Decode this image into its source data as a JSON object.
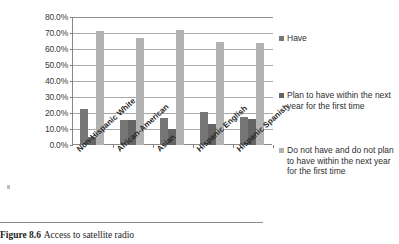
{
  "chart_data": {
    "type": "bar",
    "title": "",
    "xlabel": "",
    "ylabel": "",
    "ylim": [
      0,
      80
    ],
    "ytick_labels": [
      "80.0%",
      "70.0%",
      "60.0%",
      "50.0%",
      "40.0%",
      "30.0%",
      "20.0%",
      "10.0%",
      "0.0%"
    ],
    "ytick_values": [
      80,
      70,
      60,
      50,
      40,
      30,
      20,
      10,
      0
    ],
    "grid": true,
    "legend_position": "right",
    "categories": [
      "Non-Hispanic White",
      "African-American",
      "Asian",
      "Hispanic English",
      "Hispanic Spanish"
    ],
    "series": [
      {
        "name": "Have",
        "color": "#767676",
        "values": [
          22.8,
          15.8,
          17.0,
          20.6,
          17.8
        ]
      },
      {
        "name": "Plan to have within the next year for the first time",
        "color": "#656565",
        "values": [
          5.2,
          15.9,
          9.8,
          12.9,
          16.4
        ]
      },
      {
        "name": "Do not have and do not plan to have within the next year for the first time",
        "color": "#b2b2b2",
        "values": [
          71.0,
          67.0,
          71.8,
          64.6,
          63.6
        ]
      }
    ]
  },
  "caption": {
    "figure_number": "Figure 8.6",
    "text": "Access to satellite radio"
  }
}
